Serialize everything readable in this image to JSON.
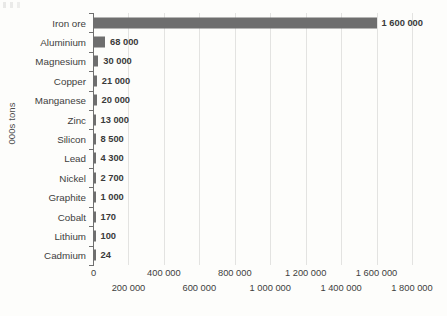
{
  "chart_data": {
    "type": "bar",
    "orientation": "horizontal",
    "title": "",
    "xlabel": "",
    "ylabel": "000s tons",
    "xlim": [
      0,
      1800000
    ],
    "xticks": [
      0,
      200000,
      400000,
      600000,
      800000,
      1000000,
      1200000,
      1400000,
      1600000,
      1800000
    ],
    "xtick_labels": [
      "0",
      "200 000",
      "400 000",
      "600 000",
      "800 000",
      "1 000 000",
      "1 200 000",
      "1 400 000",
      "1 600 000",
      "1 800 000"
    ],
    "grid": true,
    "grid_axis": "x",
    "legend": false,
    "bar_color": "#6e6e6e",
    "gridline_color": "#e3e3e1",
    "axis_color": "#6f6f6f",
    "label_color": "#3d3d3d",
    "background_color": "#fdfdfb",
    "categories": [
      "Iron ore",
      "Aluminium",
      "Magnesium",
      "Copper",
      "Manganese",
      "Zinc",
      "Silicon",
      "Lead",
      "Nickel",
      "Graphite",
      "Cobalt",
      "Lithium",
      "Cadmium"
    ],
    "values": [
      1600000,
      68000,
      30000,
      21000,
      20000,
      13000,
      8500,
      4300,
      2700,
      1000,
      170,
      100,
      24
    ],
    "value_labels": [
      "1 600 000",
      "68 000",
      "30 000",
      "21 000",
      "20 000",
      "13 000",
      "8 500",
      "4 300",
      "2 700",
      "1 000",
      "170",
      "100",
      "24"
    ]
  }
}
